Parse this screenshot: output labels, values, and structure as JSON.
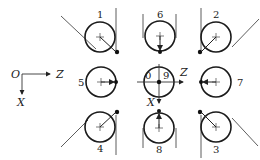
{
  "diagram": {
    "type": "tool-tip quadrant positions (lathe tool nose orientation codes)",
    "axes": {
      "origin_label": "O",
      "z_label": "Z",
      "x_label": "X",
      "center_z_label": "Z",
      "center_x_label": "X"
    },
    "positions": [
      {
        "id": "1",
        "label": "1",
        "row": 0,
        "col": 0
      },
      {
        "id": "6",
        "label": "6",
        "row": 0,
        "col": 1
      },
      {
        "id": "2",
        "label": "2",
        "row": 0,
        "col": 2
      },
      {
        "id": "5",
        "label": "5",
        "row": 1,
        "col": 0
      },
      {
        "id": "0-9",
        "label_left": "0",
        "label_right": "9",
        "row": 1,
        "col": 1
      },
      {
        "id": "7",
        "label": "7",
        "row": 1,
        "col": 2
      },
      {
        "id": "4",
        "label": "4",
        "row": 2,
        "col": 0
      },
      {
        "id": "8",
        "label": "8",
        "row": 2,
        "col": 1
      },
      {
        "id": "3",
        "label": "3",
        "row": 2,
        "col": 2
      }
    ],
    "colors": {
      "stroke": "#1a1a1a",
      "background": "#ffffff"
    }
  }
}
